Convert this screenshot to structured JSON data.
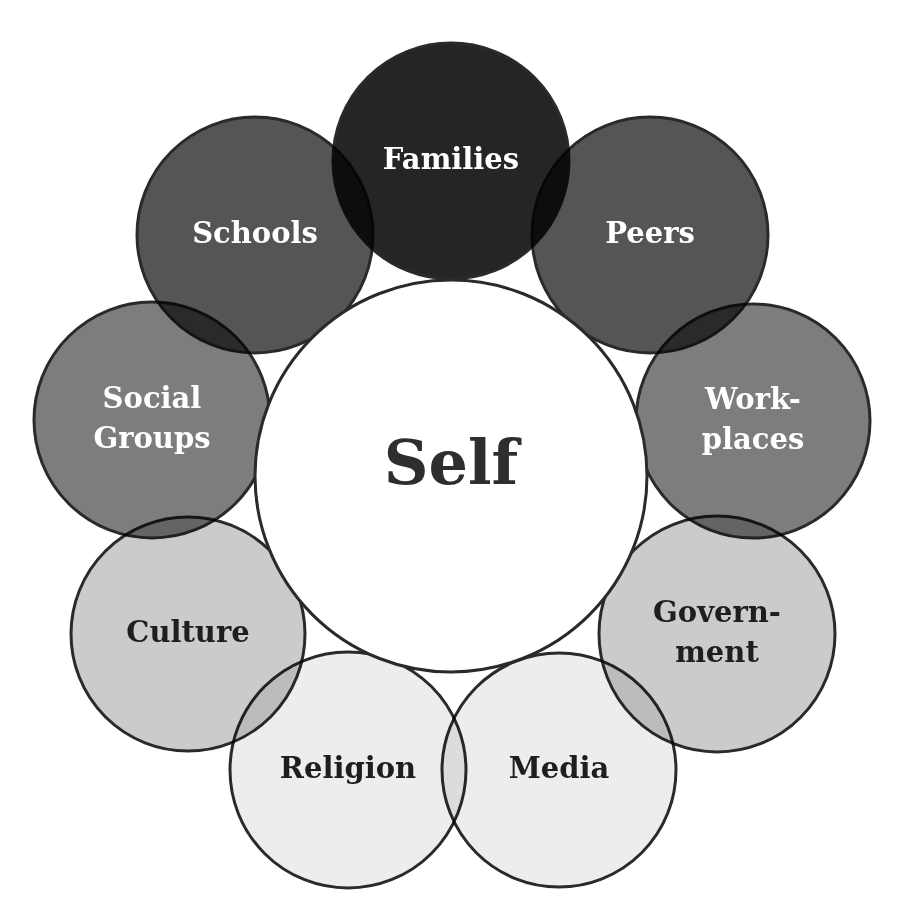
{
  "diagram": {
    "center": {
      "label": "Self",
      "cx": 451,
      "cy": 476,
      "r": 196,
      "fill": "#ffffff",
      "text_color": "#2e2e2e"
    },
    "nodes": [
      {
        "id": "families",
        "lines": [
          "Families"
        ],
        "cx": 451,
        "cy": 161,
        "r": 118,
        "fill": "#252525",
        "text_color": "#ffffff"
      },
      {
        "id": "peers",
        "lines": [
          "Peers"
        ],
        "cx": 650,
        "cy": 235,
        "r": 118,
        "fill": "#555555",
        "text_color": "#ffffff"
      },
      {
        "id": "workplaces",
        "lines": [
          "Work-",
          "places"
        ],
        "cx": 753,
        "cy": 421,
        "r": 117,
        "fill": "#7d7d7d",
        "text_color": "#ffffff"
      },
      {
        "id": "government",
        "lines": [
          "Govern-",
          "ment"
        ],
        "cx": 717,
        "cy": 634,
        "r": 118,
        "fill": "#cbcbcb",
        "text_color": "#1e1e1e"
      },
      {
        "id": "media",
        "lines": [
          "Media"
        ],
        "cx": 559,
        "cy": 770,
        "r": 117,
        "fill": "#ededed",
        "text_color": "#1e1e1e"
      },
      {
        "id": "religion",
        "lines": [
          "Religion"
        ],
        "cx": 348,
        "cy": 770,
        "r": 118,
        "fill": "#ededed",
        "text_color": "#1e1e1e"
      },
      {
        "id": "culture",
        "lines": [
          "Culture"
        ],
        "cx": 188,
        "cy": 634,
        "r": 117,
        "fill": "#cbcbcb",
        "text_color": "#1e1e1e"
      },
      {
        "id": "social-groups",
        "lines": [
          "Social",
          "Groups"
        ],
        "cx": 152,
        "cy": 420,
        "r": 118,
        "fill": "#7d7d7d",
        "text_color": "#ffffff"
      },
      {
        "id": "schools",
        "lines": [
          "Schools"
        ],
        "cx": 255,
        "cy": 235,
        "r": 118,
        "fill": "#555555",
        "text_color": "#ffffff"
      }
    ]
  }
}
